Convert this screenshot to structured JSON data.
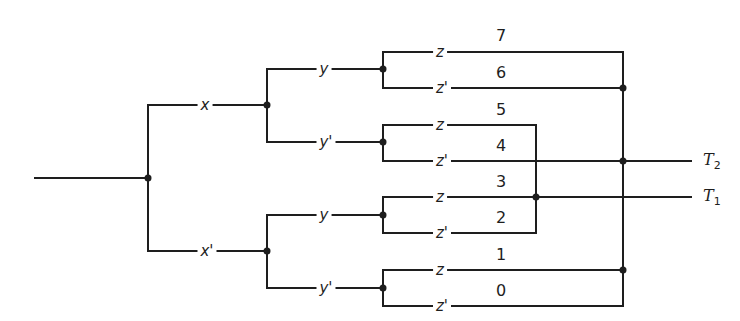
{
  "diagram": {
    "type": "contact-tree / decision tree switching network",
    "colors": {
      "line": "#1e1e1e",
      "background": "#ffffff"
    },
    "input": {
      "label": ""
    },
    "level1": {
      "top": "x",
      "bottom": "x'"
    },
    "level2": {
      "top_y": "y",
      "top_yprime": "y'",
      "bottom_y": "y",
      "bottom_yprime": "y'"
    },
    "level3": {
      "z7": "z",
      "z6": "z'",
      "z5": "z",
      "z4": "z'",
      "z3": "z",
      "z2": "z'",
      "z1": "z",
      "z0": "z'"
    },
    "minterms": [
      "7",
      "6",
      "5",
      "4",
      "3",
      "2",
      "1",
      "0"
    ],
    "outputs": {
      "t2": {
        "letter": "T",
        "sub": "2",
        "minterms": [
          "7",
          "6",
          "4",
          "1",
          "0"
        ]
      },
      "t1": {
        "letter": "T",
        "sub": "1",
        "minterms": [
          "5",
          "3",
          "2"
        ]
      }
    }
  }
}
